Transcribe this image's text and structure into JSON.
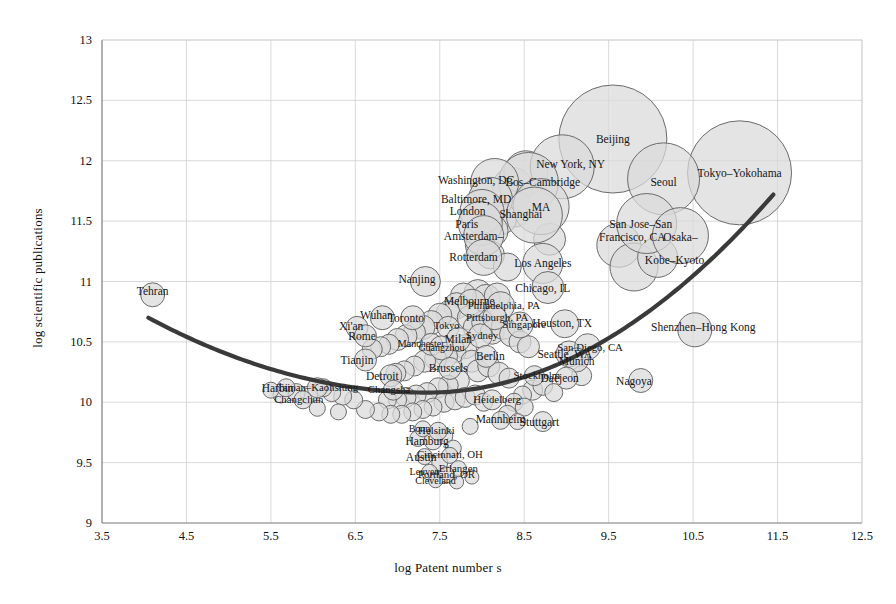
{
  "chart_data": {
    "type": "scatter",
    "title": "",
    "xlabel": "log Patent number s",
    "ylabel": "log scientific publications",
    "xlim": [
      3.5,
      12.5
    ],
    "ylim": [
      9,
      13
    ],
    "xticks": [
      "3.5",
      "4.5",
      "5.5",
      "6.5",
      "7.5",
      "8.5",
      "9.5",
      "10.5",
      "11.5",
      "12.5"
    ],
    "yticks": [
      "9",
      "9.5",
      "10",
      "10.5",
      "11",
      "11.5",
      "12",
      "12.5",
      "13"
    ],
    "grid": true,
    "legend": "none",
    "bubble_fill": "#d9d9d9",
    "bubble_stroke": "#6b6b6b",
    "trend_color": "#3a3a3a",
    "grid_color": "#cfcfcf",
    "axis_color": "#8a8a8a",
    "note": "Bubble area encodes city size; x = log patents, y = log scientific publications",
    "trendline": {
      "shape": "u-curve",
      "x_start": 4.05,
      "y_start": 10.7,
      "x_min": 7.35,
      "y_min": 10.08,
      "x_end": 11.45,
      "y_end": 11.72
    },
    "points": [
      {
        "label": "Tehran",
        "x": 4.1,
        "y": 10.89,
        "r": 12,
        "lx": 4.1,
        "ly": 10.92,
        "cls": ""
      },
      {
        "label": "Beijing",
        "x": 9.55,
        "y": 12.18,
        "r": 54,
        "lx": 9.55,
        "ly": 12.18,
        "cls": ""
      },
      {
        "label": "Tokyo–Yokohama",
        "x": 11.05,
        "y": 11.9,
        "r": 52,
        "lx": 11.05,
        "ly": 11.9,
        "cls": ""
      },
      {
        "label": "Seoul",
        "x": 10.15,
        "y": 11.85,
        "r": 36,
        "lx": 10.15,
        "ly": 11.82,
        "cls": ""
      },
      {
        "label": "New York, NY",
        "x": 8.95,
        "y": 11.95,
        "r": 32,
        "lx": 9.05,
        "ly": 11.97,
        "cls": ""
      },
      {
        "label": "Bos–Cambridge",
        "x": 8.55,
        "y": 11.82,
        "r": 30,
        "lx": 8.72,
        "ly": 11.82,
        "cls": ""
      },
      {
        "label": "MA",
        "x": 8.7,
        "y": 11.62,
        "r": 28,
        "lx": 8.7,
        "ly": 11.62,
        "cls": ""
      },
      {
        "label": "Washington, DC",
        "x": 8.15,
        "y": 11.82,
        "r": 24,
        "lx": 7.93,
        "ly": 11.84,
        "cls": ""
      },
      {
        "label": "Baltimore, MD",
        "x": 8.1,
        "y": 11.68,
        "r": 22,
        "lx": 7.93,
        "ly": 11.68,
        "cls": ""
      },
      {
        "label": "London",
        "x": 8.0,
        "y": 11.58,
        "r": 22,
        "lx": 7.83,
        "ly": 11.58,
        "cls": ""
      },
      {
        "label": "Paris",
        "x": 7.98,
        "y": 11.48,
        "r": 22,
        "lx": 7.82,
        "ly": 11.48,
        "cls": ""
      },
      {
        "label": "Amsterdam–",
        "x": 8.02,
        "y": 11.38,
        "r": 20,
        "lx": 7.9,
        "ly": 11.38,
        "cls": ""
      },
      {
        "label": "Rotterdam",
        "x": 8.02,
        "y": 11.2,
        "r": 18,
        "lx": 7.9,
        "ly": 11.2,
        "cls": ""
      },
      {
        "label": "Shanghai",
        "x": 8.62,
        "y": 11.55,
        "r": 28,
        "lx": 8.46,
        "ly": 11.56,
        "cls": ""
      },
      {
        "label": "San Jose–San",
        "x": 9.95,
        "y": 11.48,
        "r": 30,
        "lx": 9.88,
        "ly": 11.48,
        "cls": ""
      },
      {
        "label": "Francisco, CA",
        "x": 9.9,
        "y": 11.38,
        "r": 0,
        "lx": 9.78,
        "ly": 11.37,
        "cls": ""
      },
      {
        "label": "Osaka–",
        "x": 10.35,
        "y": 11.38,
        "r": 28,
        "lx": 10.35,
        "ly": 11.37,
        "cls": ""
      },
      {
        "label": "Kobe–Kyoto",
        "x": 10.3,
        "y": 11.18,
        "r": 0,
        "lx": 10.28,
        "ly": 11.18,
        "cls": ""
      },
      {
        "label": "Los Angeles",
        "x": 8.72,
        "y": 11.15,
        "r": 20,
        "lx": 8.72,
        "ly": 11.15,
        "cls": ""
      },
      {
        "label": "Chicago, IL",
        "x": 8.78,
        "y": 10.95,
        "r": 16,
        "lx": 8.72,
        "ly": 10.95,
        "cls": ""
      },
      {
        "label": "Nanjing",
        "x": 7.33,
        "y": 11.0,
        "r": 15,
        "lx": 7.23,
        "ly": 11.02,
        "cls": ""
      },
      {
        "label": "Shenzhen–Hong Kong",
        "x": 10.52,
        "y": 10.6,
        "r": 17,
        "lx": 10.62,
        "ly": 10.62,
        "cls": ""
      },
      {
        "label": "Nagoya",
        "x": 9.88,
        "y": 10.18,
        "r": 12,
        "lx": 9.8,
        "ly": 10.18,
        "cls": ""
      },
      {
        "label": "Houston, TX",
        "x": 8.98,
        "y": 10.65,
        "r": 14,
        "lx": 8.95,
        "ly": 10.66,
        "cls": ""
      },
      {
        "label": "Seattle, WA",
        "x": 9.03,
        "y": 10.4,
        "r": 13,
        "lx": 8.98,
        "ly": 10.4,
        "cls": ""
      },
      {
        "label": "San Diego, CA",
        "x": 9.25,
        "y": 10.46,
        "r": 13,
        "lx": 9.28,
        "ly": 10.45,
        "cls": "small"
      },
      {
        "label": "Munich",
        "x": 9.12,
        "y": 10.35,
        "r": 12,
        "lx": 9.12,
        "ly": 10.34,
        "cls": ""
      },
      {
        "label": "Daejeon",
        "x": 9.0,
        "y": 10.2,
        "r": 11,
        "lx": 8.92,
        "ly": 10.2,
        "cls": ""
      },
      {
        "label": "Melbourne",
        "x": 7.88,
        "y": 10.82,
        "r": 14,
        "lx": 7.85,
        "ly": 10.84,
        "cls": ""
      },
      {
        "label": "Philadelphia, PA",
        "x": 8.22,
        "y": 10.8,
        "r": 14,
        "lx": 8.26,
        "ly": 10.8,
        "cls": "small"
      },
      {
        "label": "Pittsburgh, PA",
        "x": 8.15,
        "y": 10.7,
        "r": 12,
        "lx": 8.18,
        "ly": 10.7,
        "cls": "small"
      },
      {
        "label": "Singapore",
        "x": 8.45,
        "y": 10.64,
        "r": 13,
        "lx": 8.5,
        "ly": 10.64,
        "cls": "small"
      },
      {
        "label": "Wuhan",
        "x": 6.82,
        "y": 10.7,
        "r": 12,
        "lx": 6.75,
        "ly": 10.72,
        "cls": ""
      },
      {
        "label": "Xi'an",
        "x": 6.52,
        "y": 10.62,
        "r": 11,
        "lx": 6.45,
        "ly": 10.63,
        "cls": ""
      },
      {
        "label": "Rome",
        "x": 6.62,
        "y": 10.55,
        "r": 11,
        "lx": 6.58,
        "ly": 10.55,
        "cls": ""
      },
      {
        "label": "Toronto",
        "x": 7.18,
        "y": 10.7,
        "r": 12,
        "lx": 7.1,
        "ly": 10.7,
        "cls": ""
      },
      {
        "label": "Tokyo",
        "x": 7.6,
        "y": 10.62,
        "r": 11,
        "lx": 7.58,
        "ly": 10.63,
        "cls": "tiny"
      },
      {
        "label": "Milan",
        "x": 7.72,
        "y": 10.52,
        "r": 12,
        "lx": 7.72,
        "ly": 10.52,
        "cls": ""
      },
      {
        "label": "Manchester",
        "x": 7.4,
        "y": 10.48,
        "r": 11,
        "lx": 7.28,
        "ly": 10.48,
        "cls": "tiny"
      },
      {
        "label": "Sydney",
        "x": 7.98,
        "y": 10.55,
        "r": 12,
        "lx": 8.0,
        "ly": 10.55,
        "cls": "small"
      },
      {
        "label": "Guangzhou",
        "x": 7.52,
        "y": 10.45,
        "r": 12,
        "lx": 7.52,
        "ly": 10.45,
        "cls": "tiny"
      },
      {
        "label": "Tianjin",
        "x": 6.62,
        "y": 10.35,
        "r": 11,
        "lx": 6.52,
        "ly": 10.35,
        "cls": ""
      },
      {
        "label": "Detroit",
        "x": 6.92,
        "y": 10.22,
        "r": 11,
        "lx": 6.82,
        "ly": 10.22,
        "cls": ""
      },
      {
        "label": "Changsha",
        "x": 6.95,
        "y": 10.1,
        "r": 10,
        "lx": 6.9,
        "ly": 10.1,
        "cls": "small"
      },
      {
        "label": "Brussels",
        "x": 7.62,
        "y": 10.28,
        "r": 11,
        "lx": 7.6,
        "ly": 10.28,
        "cls": ""
      },
      {
        "label": "Berlin",
        "x": 8.05,
        "y": 10.38,
        "r": 11,
        "lx": 8.1,
        "ly": 10.38,
        "cls": ""
      },
      {
        "label": "Stockholm",
        "x": 8.62,
        "y": 10.22,
        "r": 10,
        "lx": 8.65,
        "ly": 10.22,
        "cls": "small"
      },
      {
        "label": "Heidelberg",
        "x": 8.12,
        "y": 10.02,
        "r": 10,
        "lx": 8.18,
        "ly": 10.02,
        "cls": "small"
      },
      {
        "label": "Harbin",
        "x": 5.68,
        "y": 10.12,
        "r": 9,
        "lx": 5.58,
        "ly": 10.12,
        "cls": ""
      },
      {
        "label": "Tainan–Kaohsiung",
        "x": 6.05,
        "y": 10.12,
        "r": 10,
        "lx": 6.05,
        "ly": 10.12,
        "cls": "small"
      },
      {
        "label": "Changchun",
        "x": 5.88,
        "y": 10.02,
        "r": 9,
        "lx": 5.83,
        "ly": 10.02,
        "cls": "small"
      },
      {
        "label": "Mannheim",
        "x": 8.22,
        "y": 9.85,
        "r": 9,
        "lx": 8.22,
        "ly": 9.86,
        "cls": ""
      },
      {
        "label": "Stuttgart",
        "x": 8.72,
        "y": 9.84,
        "r": 10,
        "lx": 8.68,
        "ly": 9.84,
        "cls": ""
      },
      {
        "label": "Hamburg",
        "x": 7.42,
        "y": 9.68,
        "r": 9,
        "lx": 7.35,
        "ly": 9.68,
        "cls": ""
      },
      {
        "label": "Helsinki",
        "x": 7.48,
        "y": 9.76,
        "r": 9,
        "lx": 7.46,
        "ly": 9.76,
        "cls": "small"
      },
      {
        "label": "Bonn",
        "x": 7.3,
        "y": 9.78,
        "r": 8,
        "lx": 7.26,
        "ly": 9.78,
        "cls": "tiny"
      },
      {
        "label": "Cincinnati, OH",
        "x": 7.62,
        "y": 9.56,
        "r": 8,
        "lx": 7.62,
        "ly": 9.56,
        "cls": "small"
      },
      {
        "label": "Austin",
        "x": 7.32,
        "y": 9.55,
        "r": 8,
        "lx": 7.28,
        "ly": 9.55,
        "cls": ""
      },
      {
        "label": "Erlangen",
        "x": 7.72,
        "y": 9.45,
        "r": 8,
        "lx": 7.72,
        "ly": 9.45,
        "cls": "small"
      },
      {
        "label": "Portland, OR",
        "x": 7.58,
        "y": 9.4,
        "r": 8,
        "lx": 7.58,
        "ly": 9.4,
        "cls": "small"
      },
      {
        "label": "Leuven",
        "x": 7.38,
        "y": 9.42,
        "r": 8,
        "lx": 7.32,
        "ly": 9.42,
        "cls": "tiny"
      },
      {
        "label": "Cleveland",
        "x": 7.45,
        "y": 9.35,
        "r": 7,
        "lx": 7.45,
        "ly": 9.35,
        "cls": "tiny"
      }
    ],
    "extra_bubbles": [
      {
        "x": 8.36,
        "y": 11.78,
        "r": 20
      },
      {
        "x": 8.52,
        "y": 11.9,
        "r": 22
      },
      {
        "x": 8.38,
        "y": 11.6,
        "r": 18
      },
      {
        "x": 8.22,
        "y": 11.52,
        "r": 16
      },
      {
        "x": 8.12,
        "y": 11.42,
        "r": 16
      },
      {
        "x": 7.98,
        "y": 11.3,
        "r": 15
      },
      {
        "x": 8.1,
        "y": 11.22,
        "r": 14
      },
      {
        "x": 8.3,
        "y": 11.12,
        "r": 14
      },
      {
        "x": 9.62,
        "y": 11.3,
        "r": 22
      },
      {
        "x": 9.8,
        "y": 11.12,
        "r": 24
      },
      {
        "x": 10.08,
        "y": 11.2,
        "r": 20
      },
      {
        "x": 8.8,
        "y": 11.35,
        "r": 16
      },
      {
        "x": 7.95,
        "y": 10.9,
        "r": 14
      },
      {
        "x": 8.05,
        "y": 10.86,
        "r": 14
      },
      {
        "x": 8.18,
        "y": 10.88,
        "r": 13
      },
      {
        "x": 7.78,
        "y": 10.88,
        "r": 13
      },
      {
        "x": 7.7,
        "y": 10.8,
        "r": 13
      },
      {
        "x": 7.6,
        "y": 10.74,
        "r": 12
      },
      {
        "x": 7.5,
        "y": 10.72,
        "r": 12
      },
      {
        "x": 7.4,
        "y": 10.66,
        "r": 12
      },
      {
        "x": 7.3,
        "y": 10.62,
        "r": 12
      },
      {
        "x": 7.2,
        "y": 10.58,
        "r": 11
      },
      {
        "x": 7.1,
        "y": 10.55,
        "r": 11
      },
      {
        "x": 7.0,
        "y": 10.52,
        "r": 11
      },
      {
        "x": 6.9,
        "y": 10.48,
        "r": 10
      },
      {
        "x": 6.8,
        "y": 10.46,
        "r": 10
      },
      {
        "x": 6.7,
        "y": 10.44,
        "r": 10
      },
      {
        "x": 7.85,
        "y": 10.7,
        "r": 12
      },
      {
        "x": 7.92,
        "y": 10.62,
        "r": 12
      },
      {
        "x": 8.02,
        "y": 10.66,
        "r": 12
      },
      {
        "x": 8.12,
        "y": 10.58,
        "r": 12
      },
      {
        "x": 8.25,
        "y": 10.62,
        "r": 12
      },
      {
        "x": 8.35,
        "y": 10.56,
        "r": 12
      },
      {
        "x": 8.45,
        "y": 10.5,
        "r": 11
      },
      {
        "x": 8.55,
        "y": 10.46,
        "r": 11
      },
      {
        "x": 7.8,
        "y": 10.46,
        "r": 12
      },
      {
        "x": 7.68,
        "y": 10.42,
        "r": 11
      },
      {
        "x": 7.58,
        "y": 10.38,
        "r": 11
      },
      {
        "x": 7.45,
        "y": 10.36,
        "r": 11
      },
      {
        "x": 7.32,
        "y": 10.34,
        "r": 11
      },
      {
        "x": 7.2,
        "y": 10.3,
        "r": 10
      },
      {
        "x": 7.08,
        "y": 10.26,
        "r": 10
      },
      {
        "x": 6.98,
        "y": 10.24,
        "r": 10
      },
      {
        "x": 7.88,
        "y": 10.34,
        "r": 11
      },
      {
        "x": 7.95,
        "y": 10.26,
        "r": 11
      },
      {
        "x": 8.08,
        "y": 10.3,
        "r": 11
      },
      {
        "x": 8.2,
        "y": 10.24,
        "r": 11
      },
      {
        "x": 8.32,
        "y": 10.2,
        "r": 10
      },
      {
        "x": 7.72,
        "y": 10.18,
        "r": 11
      },
      {
        "x": 7.6,
        "y": 10.14,
        "r": 10
      },
      {
        "x": 7.48,
        "y": 10.12,
        "r": 10
      },
      {
        "x": 7.35,
        "y": 10.08,
        "r": 10
      },
      {
        "x": 7.22,
        "y": 10.06,
        "r": 10
      },
      {
        "x": 7.1,
        "y": 10.04,
        "r": 10
      },
      {
        "x": 7.0,
        "y": 10.02,
        "r": 9
      },
      {
        "x": 6.88,
        "y": 10.02,
        "r": 9
      },
      {
        "x": 7.55,
        "y": 10.0,
        "r": 10
      },
      {
        "x": 7.68,
        "y": 10.02,
        "r": 10
      },
      {
        "x": 7.8,
        "y": 10.04,
        "r": 10
      },
      {
        "x": 7.92,
        "y": 10.06,
        "r": 10
      },
      {
        "x": 8.02,
        "y": 10.0,
        "r": 9
      },
      {
        "x": 7.42,
        "y": 9.96,
        "r": 9
      },
      {
        "x": 7.3,
        "y": 9.94,
        "r": 9
      },
      {
        "x": 7.18,
        "y": 9.92,
        "r": 9
      },
      {
        "x": 7.05,
        "y": 9.9,
        "r": 9
      },
      {
        "x": 6.92,
        "y": 9.9,
        "r": 9
      },
      {
        "x": 6.78,
        "y": 9.92,
        "r": 9
      },
      {
        "x": 6.62,
        "y": 9.94,
        "r": 9
      },
      {
        "x": 6.48,
        "y": 10.02,
        "r": 9
      },
      {
        "x": 6.35,
        "y": 10.05,
        "r": 9
      },
      {
        "x": 6.22,
        "y": 10.08,
        "r": 9
      },
      {
        "x": 6.12,
        "y": 10.12,
        "r": 9
      },
      {
        "x": 5.95,
        "y": 10.06,
        "r": 9
      },
      {
        "x": 5.8,
        "y": 10.08,
        "r": 9
      },
      {
        "x": 5.62,
        "y": 10.06,
        "r": 8
      },
      {
        "x": 5.5,
        "y": 10.1,
        "r": 8
      },
      {
        "x": 8.6,
        "y": 10.1,
        "r": 10
      },
      {
        "x": 8.72,
        "y": 10.14,
        "r": 10
      },
      {
        "x": 8.85,
        "y": 10.08,
        "r": 9
      },
      {
        "x": 8.48,
        "y": 10.06,
        "r": 9
      },
      {
        "x": 8.38,
        "y": 10.0,
        "r": 9
      },
      {
        "x": 8.5,
        "y": 9.96,
        "r": 9
      },
      {
        "x": 9.18,
        "y": 10.22,
        "r": 10
      },
      {
        "x": 8.3,
        "y": 9.9,
        "r": 9
      },
      {
        "x": 8.42,
        "y": 9.84,
        "r": 8
      },
      {
        "x": 7.86,
        "y": 9.8,
        "r": 8
      },
      {
        "x": 7.56,
        "y": 9.72,
        "r": 8
      },
      {
        "x": 7.24,
        "y": 9.7,
        "r": 8
      },
      {
        "x": 7.66,
        "y": 9.62,
        "r": 8
      },
      {
        "x": 7.5,
        "y": 9.5,
        "r": 8
      },
      {
        "x": 7.88,
        "y": 9.38,
        "r": 7
      },
      {
        "x": 7.7,
        "y": 9.34,
        "r": 7
      },
      {
        "x": 6.3,
        "y": 9.92,
        "r": 8
      },
      {
        "x": 6.05,
        "y": 9.95,
        "r": 8
      }
    ]
  }
}
